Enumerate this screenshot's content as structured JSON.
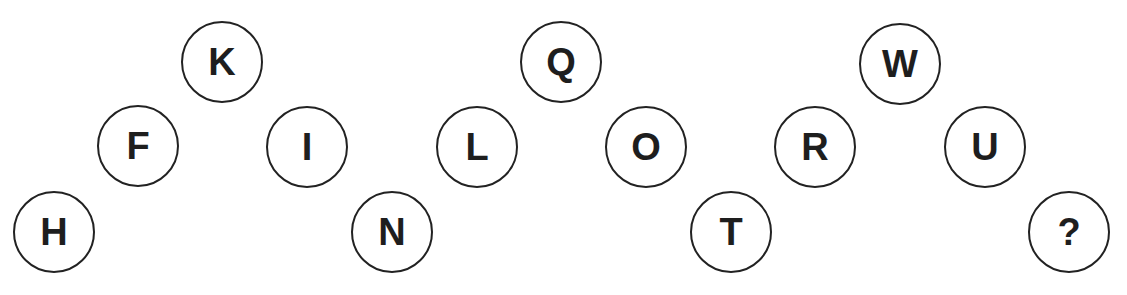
{
  "puzzle": {
    "nodes": [
      {
        "label": "H",
        "x": 54,
        "y": 232
      },
      {
        "label": "F",
        "x": 138,
        "y": 146
      },
      {
        "label": "K",
        "x": 222,
        "y": 62
      },
      {
        "label": "I",
        "x": 307,
        "y": 147
      },
      {
        "label": "N",
        "x": 392,
        "y": 232
      },
      {
        "label": "L",
        "x": 477,
        "y": 147
      },
      {
        "label": "Q",
        "x": 561,
        "y": 62
      },
      {
        "label": "O",
        "x": 646,
        "y": 147
      },
      {
        "label": "T",
        "x": 731,
        "y": 232
      },
      {
        "label": "R",
        "x": 815,
        "y": 147
      },
      {
        "label": "W",
        "x": 900,
        "y": 64
      },
      {
        "label": "U",
        "x": 985,
        "y": 147
      },
      {
        "label": "?",
        "x": 1069,
        "y": 232
      }
    ],
    "circle_color": "#222222",
    "text_color": "#1e1e1e"
  }
}
